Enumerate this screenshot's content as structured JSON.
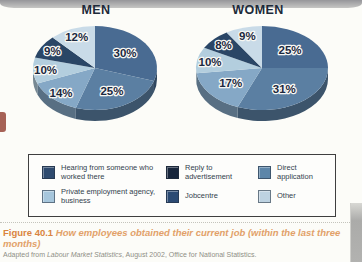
{
  "page": {
    "background": "#fcfcf8"
  },
  "chart_data": {
    "type": "pie",
    "style": "3d",
    "start_angle_deg": -90,
    "direction": "clockwise",
    "title": "How employees obtained their current job (within the last three months)",
    "categories": [
      "Hearing from someone who worked there",
      "Reply to advertisement",
      "Direct application",
      "Private employment agency, business",
      "Jobcentre",
      "Other"
    ],
    "slice_colors": [
      "#496b92",
      "#5b7fa2",
      "#85a8c6",
      "#b3cede",
      "#2a4666",
      "#c9dbe8"
    ],
    "charts": [
      {
        "title": "MEN",
        "values": [
          30,
          25,
          14,
          10,
          9,
          12
        ]
      },
      {
        "title": "WOMEN",
        "values": [
          25,
          31,
          17,
          10,
          8,
          9
        ]
      }
    ]
  },
  "legend": {
    "items": [
      {
        "label": "Hearing from someone who worked there",
        "color": "#2e4a6e"
      },
      {
        "label": "Reply to advertisement",
        "color": "#17263c"
      },
      {
        "label": "Direct application",
        "color": "#5d86a9"
      },
      {
        "label": "Private employment agency, business",
        "color": "#a6c6dc"
      },
      {
        "label": "Jobcentre",
        "color": "#2b4a73"
      },
      {
        "label": "Other",
        "color": "#bdd2e1"
      }
    ]
  },
  "caption": {
    "figure_label": "Figure 40.1",
    "title": "How employees obtained their current job (within the last three months)",
    "accent_color": "#d98440",
    "source_prefix": "Adapted from ",
    "source_italic": "Labour Market Statistics",
    "source_suffix": ", August 2002, Office for National Statistics."
  }
}
